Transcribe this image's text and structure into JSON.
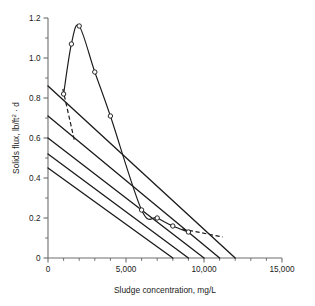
{
  "chart_data": {
    "type": "line",
    "title": "",
    "xlabel": "Sludge concentration, mg/L",
    "ylabel": "Solids flux, lb/ft2 · d",
    "ylabel_parts": {
      "prefix": "Solids flux, lb/ft",
      "exponent": "2",
      "suffix": " · d"
    },
    "xlim": [
      0,
      15000
    ],
    "ylim": [
      0,
      1.2
    ],
    "grid": false,
    "legend": "none",
    "x_ticks_major": [
      0,
      5000,
      10000,
      15000
    ],
    "x_tick_labels": [
      "0",
      "5,000",
      "10,000",
      "15,000"
    ],
    "x_ticks_minor": [
      1000,
      2000,
      3000,
      4000,
      6000,
      7000,
      8000,
      9000,
      11000,
      12000,
      13000,
      14000
    ],
    "y_ticks_major": [
      0,
      0.2,
      0.4,
      0.6,
      0.8,
      1.0,
      1.2
    ],
    "y_tick_labels": [
      "0",
      "0.2",
      "0.4",
      "0.6",
      "0.8",
      "1.0",
      "1.2"
    ],
    "y_ticks_minor": [
      0.1,
      0.3,
      0.5,
      0.7,
      0.9,
      1.1
    ],
    "series": [
      {
        "name": "Solids flux curve",
        "style": "solid-with-markers",
        "color": "#1c1c1c",
        "x": [
          1000,
          1500,
          2000,
          3000,
          4000,
          6000,
          7000,
          8000,
          9000
        ],
        "y": [
          0.82,
          1.07,
          1.16,
          0.93,
          0.71,
          0.24,
          0.2,
          0.16,
          0.13
        ]
      },
      {
        "name": "Operating line 1",
        "style": "solid",
        "color": "#1c1c1c",
        "x": [
          0,
          12000
        ],
        "y": [
          0.86,
          0.0
        ],
        "y_intercept": 0.86,
        "x_intercept": 12000
      },
      {
        "name": "Operating line 2",
        "style": "solid",
        "color": "#1c1c1c",
        "x": [
          0,
          11000
        ],
        "y": [
          0.71,
          0.0
        ],
        "y_intercept": 0.71,
        "x_intercept": 11000
      },
      {
        "name": "Operating line 3",
        "style": "solid",
        "color": "#1c1c1c",
        "x": [
          0,
          10000
        ],
        "y": [
          0.6,
          0.0
        ],
        "y_intercept": 0.6,
        "x_intercept": 10000
      },
      {
        "name": "Operating line 4",
        "style": "solid",
        "color": "#1c1c1c",
        "x": [
          0,
          9000
        ],
        "y": [
          0.52,
          0.0
        ],
        "y_intercept": 0.52,
        "x_intercept": 9000
      },
      {
        "name": "Operating line 5",
        "style": "solid",
        "color": "#1c1c1c",
        "x": [
          0,
          8000
        ],
        "y": [
          0.45,
          0.0
        ],
        "y_intercept": 0.45,
        "x_intercept": 8000
      },
      {
        "name": "Dashed tangent left",
        "style": "dashed",
        "color": "#1c1c1c",
        "x": [
          950,
          1700
        ],
        "y": [
          0.845,
          0.585
        ]
      },
      {
        "name": "Dashed tangent right",
        "style": "dashed",
        "color": "#1c1c1c",
        "x": [
          8600,
          11200
        ],
        "y": [
          0.145,
          0.105
        ]
      }
    ],
    "markers": {
      "shape": "circle-open",
      "x": [
        1000,
        1500,
        2000,
        3000,
        4000,
        6000,
        7000,
        8000,
        9000
      ],
      "y": [
        0.82,
        1.07,
        1.16,
        0.93,
        0.71,
        0.24,
        0.2,
        0.16,
        0.13
      ]
    },
    "convergence_point": {
      "x": 6000,
      "y": 0.24
    },
    "colors": {
      "line": "#1c1c1c",
      "axis": "#6e6e6e",
      "text": "#1a1a1a",
      "background": "#ffffff"
    }
  }
}
